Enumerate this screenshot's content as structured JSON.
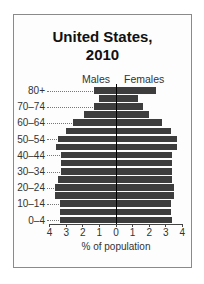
{
  "chart_data": {
    "type": "bar",
    "subtype": "population-pyramid",
    "title": "United States, 2010",
    "title_lines": [
      "United States,",
      "2010"
    ],
    "xlabel": "% of population",
    "ylabel": "",
    "xlim": [
      -4,
      4
    ],
    "x_ticks": [
      -4,
      -3,
      -2,
      -1,
      0,
      1,
      2,
      3,
      4
    ],
    "x_tick_labels": [
      "4",
      "3",
      "2",
      "1",
      "0",
      "1",
      "2",
      "3",
      "4"
    ],
    "grid": false,
    "legend": [
      "Males",
      "Females"
    ],
    "categories": [
      "0-4",
      "5-9",
      "10-14",
      "15-19",
      "20-24",
      "25-29",
      "30-34",
      "35-39",
      "40-44",
      "45-49",
      "50-54",
      "55-59",
      "60-64",
      "65-69",
      "70-74",
      "75-79",
      "80+"
    ],
    "labeled_categories": [
      "0–4",
      "10–14",
      "20–24",
      "30–34",
      "40–44",
      "50–54",
      "60–64",
      "70–74",
      "80+"
    ],
    "series": [
      {
        "name": "Males",
        "values": [
          3.4,
          3.4,
          3.4,
          3.7,
          3.7,
          3.5,
          3.3,
          3.3,
          3.3,
          3.6,
          3.5,
          3.0,
          2.6,
          1.9,
          1.3,
          1.0,
          1.3
        ]
      },
      {
        "name": "Females",
        "values": [
          3.4,
          3.3,
          3.3,
          3.5,
          3.5,
          3.4,
          3.4,
          3.4,
          3.4,
          3.7,
          3.7,
          3.3,
          2.8,
          2.0,
          1.6,
          1.3,
          2.4
        ]
      }
    ],
    "colors": {
      "bar": "#3d3d3d",
      "axis": "#000000",
      "frame": "#8a8a8a"
    }
  },
  "labels": {
    "title_line1": "United States,",
    "title_line2": "2010",
    "males": "Males",
    "females": "Females",
    "xlabel": "% of population"
  }
}
